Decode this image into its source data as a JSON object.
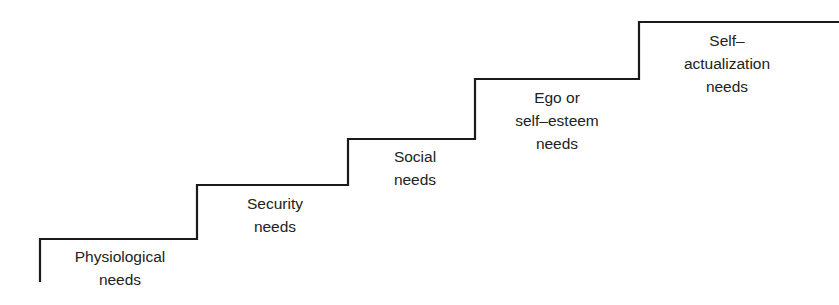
{
  "diagram": {
    "type": "staircase",
    "title": "",
    "line_color": "#1a1a1a",
    "steps": [
      {
        "order": 1,
        "lines": [
          "Physiological",
          "needs"
        ]
      },
      {
        "order": 2,
        "lines": [
          "Security",
          "needs"
        ]
      },
      {
        "order": 3,
        "lines": [
          "Social",
          "needs"
        ]
      },
      {
        "order": 4,
        "lines": [
          "Ego or",
          "self–esteem",
          "needs"
        ]
      },
      {
        "order": 5,
        "lines": [
          "Self–",
          "actualization",
          "needs"
        ]
      }
    ]
  }
}
